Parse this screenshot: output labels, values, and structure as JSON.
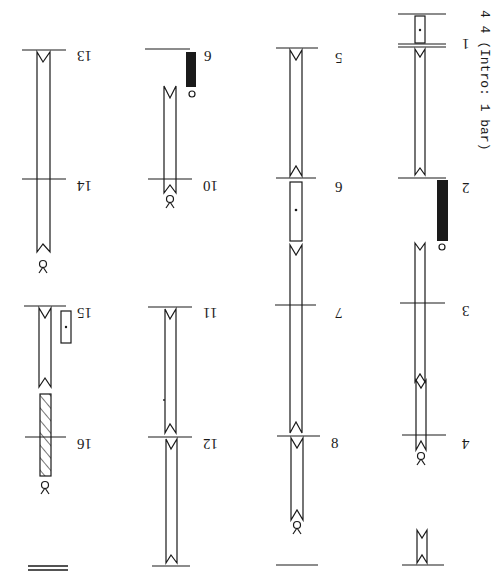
{
  "header": {
    "time_signature": "4 4",
    "intro_note": "(Intro: 1 bar)"
  },
  "columns": [
    {
      "id": "column-1",
      "x": 422,
      "bars": [
        {
          "number": "1",
          "y": 47
        },
        {
          "number": "2",
          "y": 178
        },
        {
          "number": "3",
          "y": 303
        },
        {
          "number": "4",
          "y": 435
        }
      ],
      "intro_bar": {
        "top_y": 14,
        "bottom_y": 44
      },
      "end_y": 565
    },
    {
      "id": "column-2",
      "x": 298,
      "bars": [
        {
          "number": "5",
          "y": 48
        },
        {
          "number": "6",
          "y": 178
        },
        {
          "number": "7",
          "y": 305
        },
        {
          "number": "8",
          "y": 435
        }
      ],
      "end_y": 565
    },
    {
      "id": "column-3",
      "x": 170,
      "bars": [
        {
          "number": "9",
          "y": 48
        },
        {
          "number": "10",
          "y": 178
        },
        {
          "number": "11",
          "y": 305
        },
        {
          "number": "12",
          "y": 435
        }
      ],
      "end_y": 565
    },
    {
      "id": "column-4",
      "x": 44,
      "bars": [
        {
          "number": "13",
          "y": 48
        },
        {
          "number": "14",
          "y": 178
        },
        {
          "number": "15",
          "y": 305
        },
        {
          "number": "16",
          "y": 435
        }
      ],
      "end_y": 568,
      "final_double_bar": true
    }
  ],
  "symbols": {
    "black_block": "place-high / filled direction sign",
    "dotted_box": "place-middle direction sign",
    "hatched_block": "place-low direction sign",
    "hold_circle": "hold sign",
    "release_sign": "release / person sign",
    "support_bracket": "support/step column"
  },
  "colors": {
    "ink": "#1a1a1a",
    "paper": "#ffffff"
  }
}
